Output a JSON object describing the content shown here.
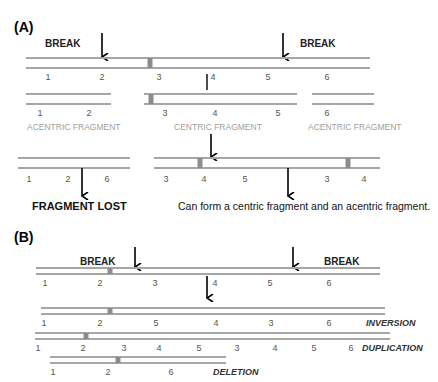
{
  "colors": {
    "strand": "#a6a6a6",
    "centromere": "#8c8c8c",
    "arrow": "#000000",
    "text": "#000000",
    "number": "#555555",
    "fragment_label": "#a0a0a0"
  },
  "panel_a": {
    "label": "(A)",
    "break_left": "BREAK",
    "break_right": "BREAK",
    "main_chromosome": {
      "x1": 26,
      "x2": 370,
      "y_top": 58,
      "y_bottom": 68,
      "centromeres": [
        150
      ],
      "numbers": [
        {
          "text": "1",
          "x": 48
        },
        {
          "text": "2",
          "x": 102
        },
        {
          "text": "3",
          "x": 159
        },
        {
          "text": "4",
          "x": 213
        },
        {
          "text": "5",
          "x": 268
        },
        {
          "text": "6",
          "x": 327
        }
      ],
      "number_y": 80
    },
    "fragments": [
      {
        "name": "acentric-left",
        "x1": 26,
        "x2": 111,
        "y_top": 94,
        "y_bottom": 104,
        "centromeres": [],
        "numbers": [
          {
            "text": "1",
            "x": 40
          },
          {
            "text": "2",
            "x": 89
          }
        ],
        "caption": "ACENTRIC FRAGMENT",
        "caption_x": 27
      },
      {
        "name": "centric",
        "x1": 144,
        "x2": 297,
        "y_top": 94,
        "y_bottom": 104,
        "centromeres": [
          151
        ],
        "numbers": [
          {
            "text": "3",
            "x": 165
          },
          {
            "text": "4",
            "x": 215
          },
          {
            "text": "5",
            "x": 278
          }
        ],
        "caption": "CENTRIC FRAGMENT",
        "caption_x": 174
      },
      {
        "name": "acentric-right",
        "x1": 312,
        "x2": 374,
        "y_top": 94,
        "y_bottom": 104,
        "centromeres": [],
        "numbers": [
          {
            "text": "6",
            "x": 327
          }
        ],
        "caption": "ACENTRIC FRAGMENT",
        "caption_x": 308
      }
    ],
    "fragment_number_y": 116,
    "fragment_caption_y": 130,
    "results": [
      {
        "name": "fused-acentric",
        "x1": 18,
        "x2": 130,
        "y_top": 158,
        "y_bottom": 168,
        "centromeres": [],
        "numbers": [
          {
            "text": "1",
            "x": 29
          },
          {
            "text": "2",
            "x": 68
          },
          {
            "text": "6",
            "x": 107
          }
        ]
      },
      {
        "name": "dicentric",
        "x1": 154,
        "x2": 380,
        "y_top": 158,
        "y_bottom": 168,
        "centromeres": [
          200,
          348
        ],
        "numbers": [
          {
            "text": "3",
            "x": 166
          },
          {
            "text": "4",
            "x": 204
          },
          {
            "text": "5",
            "x": 245
          },
          {
            "text": "3",
            "x": 327
          },
          {
            "text": "4",
            "x": 364
          }
        ]
      }
    ],
    "result_number_y": 182,
    "fragment_lost": "FRAGMENT LOST",
    "dicentric_note": "Can form a centric fragment and an acentric fragment."
  },
  "panel_b": {
    "label": "(B)",
    "break_left": "BREAK",
    "break_right": "BREAK",
    "rows": [
      {
        "name": "original",
        "x1": 36,
        "x2": 380,
        "y_top": 268,
        "y_bottom": 274,
        "centromeres": [
          110
        ],
        "number_y": 286,
        "numbers": [
          {
            "text": "1",
            "x": 45
          },
          {
            "text": "2",
            "x": 100
          },
          {
            "text": "3",
            "x": 155
          },
          {
            "text": "4",
            "x": 215
          },
          {
            "text": "5",
            "x": 270
          },
          {
            "text": "6",
            "x": 329
          }
        ],
        "caption": ""
      },
      {
        "name": "inversion",
        "x1": 41,
        "x2": 385,
        "y_top": 308,
        "y_bottom": 314,
        "centromeres": [
          110
        ],
        "number_y": 326,
        "numbers": [
          {
            "text": "1",
            "x": 44
          },
          {
            "text": "2",
            "x": 100
          },
          {
            "text": "5",
            "x": 156
          },
          {
            "text": "4",
            "x": 216
          },
          {
            "text": "3",
            "x": 271
          },
          {
            "text": "6",
            "x": 329
          }
        ],
        "caption": "INVERSION",
        "caption_x": 366
      },
      {
        "name": "duplication",
        "x1": 35,
        "x2": 390,
        "y_top": 333,
        "y_bottom": 339,
        "centromeres": [
          86
        ],
        "number_y": 351,
        "numbers": [
          {
            "text": "1",
            "x": 38
          },
          {
            "text": "2",
            "x": 83
          },
          {
            "text": "3",
            "x": 124
          },
          {
            "text": "4",
            "x": 159
          },
          {
            "text": "5",
            "x": 199
          },
          {
            "text": "3",
            "x": 237
          },
          {
            "text": "4",
            "x": 275
          },
          {
            "text": "5",
            "x": 314
          },
          {
            "text": "6",
            "x": 351
          }
        ],
        "caption": "DUPLICATION",
        "caption_x": 362
      },
      {
        "name": "deletion",
        "x1": 50,
        "x2": 226,
        "y_top": 357,
        "y_bottom": 363,
        "centromeres": [
          118
        ],
        "number_y": 375,
        "numbers": [
          {
            "text": "1",
            "x": 53
          },
          {
            "text": "2",
            "x": 108
          },
          {
            "text": "6",
            "x": 171
          }
        ],
        "caption": "DELETION",
        "caption_x": 213
      }
    ]
  }
}
